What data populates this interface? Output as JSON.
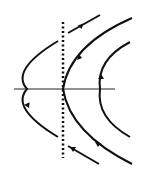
{
  "figure": {
    "type": "phase-portrait",
    "colors": {
      "stroke": "#111111",
      "background": "#ffffff"
    },
    "elements": {
      "axis": "horizontal-axis",
      "separatrix": "dotted-vertical-line",
      "trajectories": [
        {
          "name": "left-trajectory",
          "arrow": "down"
        },
        {
          "name": "middle-trajectory",
          "arrow_top": "up-right",
          "arrow_bottom": "up-left"
        },
        {
          "name": "right-trajectory",
          "arrow": "up"
        },
        {
          "name": "top-segment",
          "arrow": "up-right"
        },
        {
          "name": "bottom-segment",
          "arrow": "up-left"
        }
      ]
    }
  }
}
